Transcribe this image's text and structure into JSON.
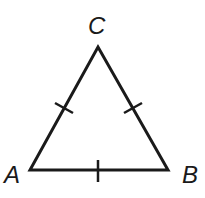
{
  "diagram": {
    "type": "geometry",
    "shape": "equilateral-triangle",
    "stroke_color": "#1a1a1a",
    "vertices": [
      {
        "label": "A",
        "x": 30,
        "y": 170
      },
      {
        "label": "B",
        "x": 168,
        "y": 170
      },
      {
        "label": "C",
        "x": 98,
        "y": 47
      }
    ],
    "sides": [
      {
        "name": "AC",
        "tick_marks": 1
      },
      {
        "name": "BC",
        "tick_marks": 1
      },
      {
        "name": "AB",
        "tick_marks": 1
      }
    ]
  },
  "labels": {
    "a": "A",
    "b": "B",
    "c": "C"
  }
}
